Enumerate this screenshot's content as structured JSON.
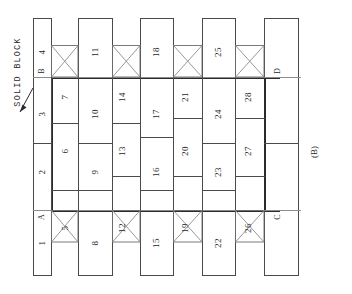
{
  "figure": {
    "caption": "(B)",
    "annotation": "SOLID BLOCK",
    "corner_labels": [
      "A",
      "B",
      "C",
      "D"
    ],
    "block_numbers": [
      "1",
      "2",
      "3",
      "4",
      "5",
      "6",
      "7",
      "8",
      "9",
      "10",
      "11",
      "12",
      "13",
      "14",
      "15",
      "16",
      "17",
      "18",
      "19",
      "20",
      "21",
      "22",
      "23",
      "24",
      "25",
      "26",
      "27",
      "28"
    ],
    "colors": {
      "line": "#4a4a4a",
      "line_heavy": "#2b2b2b",
      "line_light": "#8c8c8c",
      "background": "#ffffff",
      "text": "#262626"
    }
  },
  "blocks": [
    {
      "id": "1",
      "cx": 42,
      "cy": 243
    },
    {
      "id": "2",
      "cx": 42,
      "cy": 172
    },
    {
      "id": "3",
      "cx": 42,
      "cy": 114
    },
    {
      "id": "4",
      "cx": 42,
      "cy": 52
    },
    {
      "id": "5",
      "cx": 65,
      "cy": 228
    },
    {
      "id": "6",
      "cx": 65,
      "cy": 151
    },
    {
      "id": "7",
      "cx": 65,
      "cy": 97
    },
    {
      "id": "8",
      "cx": 95,
      "cy": 243
    },
    {
      "id": "9",
      "cx": 95,
      "cy": 172
    },
    {
      "id": "10",
      "cx": 95,
      "cy": 114
    },
    {
      "id": "11",
      "cx": 95,
      "cy": 52
    },
    {
      "id": "12",
      "cx": 122,
      "cy": 228
    },
    {
      "id": "13",
      "cx": 122,
      "cy": 151
    },
    {
      "id": "14",
      "cx": 122,
      "cy": 97
    },
    {
      "id": "15",
      "cx": 156,
      "cy": 243
    },
    {
      "id": "16",
      "cx": 156,
      "cy": 172
    },
    {
      "id": "17",
      "cx": 156,
      "cy": 114
    },
    {
      "id": "18",
      "cx": 156,
      "cy": 52
    },
    {
      "id": "19",
      "cx": 185,
      "cy": 228
    },
    {
      "id": "20",
      "cx": 185,
      "cy": 151
    },
    {
      "id": "21",
      "cx": 185,
      "cy": 97
    },
    {
      "id": "22",
      "cx": 218,
      "cy": 243
    },
    {
      "id": "23",
      "cx": 218,
      "cy": 172
    },
    {
      "id": "24",
      "cx": 218,
      "cy": 114
    },
    {
      "id": "25",
      "cx": 218,
      "cy": 52
    },
    {
      "id": "26",
      "cx": 248,
      "cy": 228
    },
    {
      "id": "27",
      "cx": 248,
      "cy": 151
    },
    {
      "id": "28",
      "cx": 248,
      "cy": 97
    }
  ],
  "corners": [
    {
      "id": "A",
      "cx": 42,
      "cy": 217
    },
    {
      "id": "B",
      "cx": 42,
      "cy": 73
    },
    {
      "id": "C",
      "cx": 278,
      "cy": 217
    },
    {
      "id": "D",
      "cx": 278,
      "cy": 73
    }
  ],
  "labels": {
    "annotation": {
      "cx": 18,
      "cy": 72
    },
    "caption": {
      "cx": 314,
      "cy": 152
    }
  }
}
